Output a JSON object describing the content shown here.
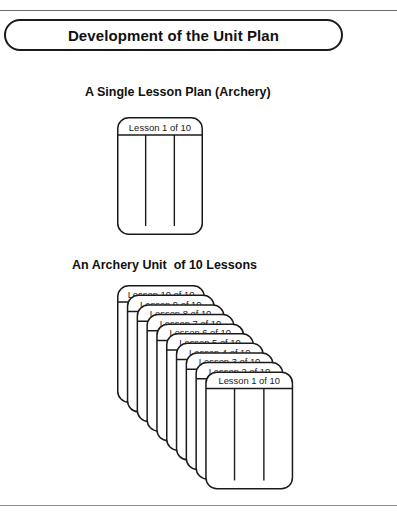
{
  "page": {
    "title": "Development of the Unit Plan",
    "background_color": "#ffffff",
    "line_color": "#1b1b1b",
    "rule_color": "#6d6d6d"
  },
  "sections": {
    "single": {
      "heading": "A Single Lesson Plan (Archery)",
      "card_label": "Lesson 1 of 10",
      "column_count": 3
    },
    "unit": {
      "heading": "An Archery Unit  of 10 Lessons",
      "card_count": 10,
      "column_count": 3,
      "card_labels": [
        "Lesson 10 of 10",
        "Lesson 9 of 10",
        "Lesson 8 of 10",
        "Lesson 7 of 10",
        "Lesson 6 of 10",
        "Lesson 5 of 10",
        "Lesson 4 of 10",
        "Lesson 3 of 10",
        "Lesson 2 of 10",
        "Lesson 1 of 10"
      ]
    }
  }
}
